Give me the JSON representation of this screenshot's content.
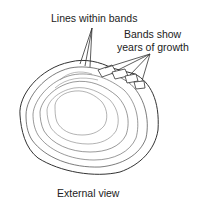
{
  "diagram": {
    "labels": {
      "lines_within_bands": "Lines within bands",
      "bands_line1": "Bands show",
      "bands_line2": "years of growth",
      "caption": "External view"
    },
    "colors": {
      "line": "#333333",
      "background": "#ffffff"
    }
  }
}
